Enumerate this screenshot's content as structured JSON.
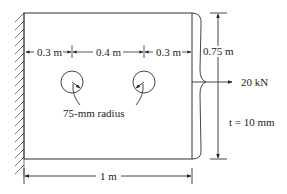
{
  "diagram": {
    "type": "plate-with-holes",
    "dimensions": {
      "left_gap": "0.3 m",
      "hole_spacing": "0.4 m",
      "right_gap": "0.3 m",
      "height": "0.75 m",
      "width": "1 m"
    },
    "hole_label": "75-mm radius",
    "load": "20 kN",
    "thickness": "t = 10 mm"
  }
}
